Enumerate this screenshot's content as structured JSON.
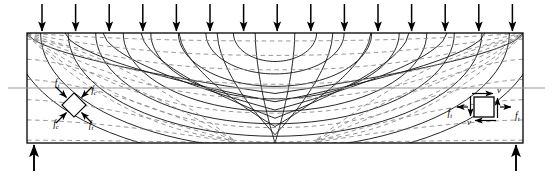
{
  "figure": {
    "kind": "principal-stress-trajectory-diagram",
    "structure": "simply-supported-beam",
    "beam": {
      "left": 27,
      "right": 523,
      "top": 33,
      "bottom": 143
    },
    "centerline_y": 88,
    "centerline_color": "#999999",
    "outline_color": "#000000",
    "solid_trajectory_color": "#1a1a1a",
    "dashed_trajectory_color": "#8a8a8a"
  },
  "loads": {
    "name": "uniform-distributed-load",
    "arrow_count": 15,
    "first_x": 42,
    "spacing": 33.6,
    "top_y": 4,
    "tip_y": 31,
    "direction": "down"
  },
  "reactions": {
    "name": "support-reactions",
    "direction": "up",
    "left_x": 34,
    "right_x": 516,
    "base_y": 171,
    "tip_y": 145
  },
  "elements": {
    "left": {
      "name": "rotated-stress-element",
      "cx": 74,
      "cy": 105,
      "size": 17,
      "rotation": 45,
      "labels": {
        "top_left": "f",
        "top_left_sub": "t",
        "top_right": "f",
        "top_right_sub": "c",
        "bottom_left": "f",
        "bottom_left_sub": "c",
        "bottom_right": "f",
        "bottom_right_sub": "t"
      }
    },
    "right": {
      "name": "upright-stress-element",
      "cx": 484,
      "cy": 107,
      "size": 20,
      "rotation": 0,
      "labels": {
        "left": "f",
        "left_sub": "t",
        "right": "f",
        "right_sub": "t",
        "shear_top": "v",
        "shear_bottom": "v",
        "shear_left": "v",
        "shear_right": "v"
      }
    }
  },
  "legend_semantics": {
    "solid": "compression-trajectory",
    "dashed": "tension-trajectory",
    "f_t": "tensile-stress",
    "f_c": "compressive-stress",
    "v": "shear-stress"
  }
}
